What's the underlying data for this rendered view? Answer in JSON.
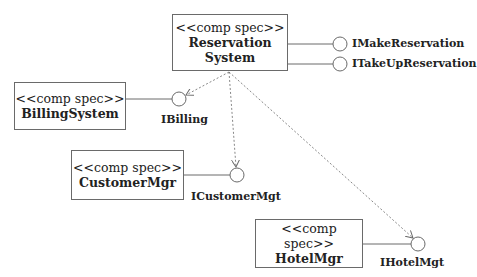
{
  "diagram": {
    "type": "UML component diagram",
    "components": [
      {
        "id": "reservation",
        "stereotype": "<<comp spec>>",
        "name_line1": "Reservation",
        "name_line2": "System"
      },
      {
        "id": "billing",
        "stereotype": "<<comp spec>>",
        "name": "BillingSystem"
      },
      {
        "id": "customer",
        "stereotype": "<<comp spec>>",
        "name": "CustomerMgr"
      },
      {
        "id": "hotel",
        "stereotype": "<<comp spec>>",
        "name": "HotelMgr"
      }
    ],
    "interfaces": [
      {
        "id": "imake",
        "label": "IMakeReservation",
        "provided_by": "reservation"
      },
      {
        "id": "itakeup",
        "label": "ITakeUpReservation",
        "provided_by": "reservation"
      },
      {
        "id": "ibilling",
        "label": "IBilling",
        "provided_by": "billing"
      },
      {
        "id": "icustomer",
        "label": "ICustomerMgt",
        "provided_by": "customer"
      },
      {
        "id": "ihotel",
        "label": "IHotelMgt",
        "provided_by": "hotel"
      }
    ],
    "dependencies": [
      {
        "from": "reservation",
        "to": "ibilling",
        "style": "dashed-arrow"
      },
      {
        "from": "reservation",
        "to": "icustomer",
        "style": "dashed-arrow"
      },
      {
        "from": "reservation",
        "to": "ihotel",
        "style": "dashed-arrow"
      }
    ],
    "colors": {
      "line": "#6a6a6a",
      "text": "#222222",
      "background": "#ffffff"
    }
  }
}
